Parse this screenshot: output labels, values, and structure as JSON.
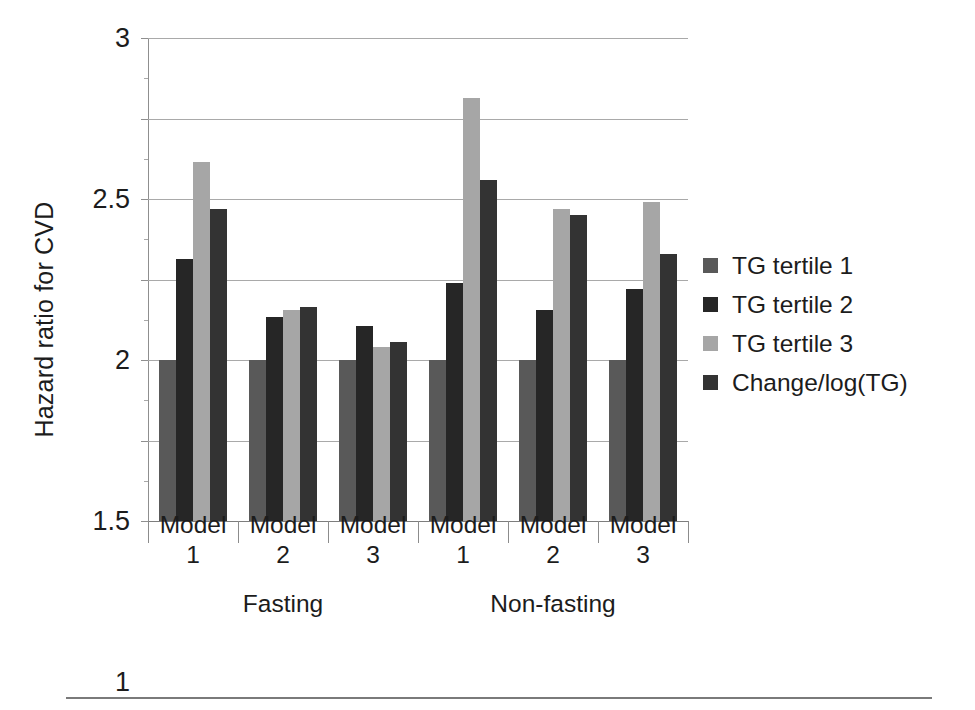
{
  "chart_data": {
    "type": "bar",
    "title": "",
    "subtitle": "",
    "xlabel": "",
    "ylabel": "Hazard ratio for CVD",
    "ylim": [
      0,
      3
    ],
    "yticks": [
      "0",
      "0.5",
      "1",
      "1.5",
      "2",
      "2.5",
      "3"
    ],
    "ytick_values": [
      0,
      0.5,
      1,
      1.5,
      2,
      2.5,
      3
    ],
    "grid": "horizontal",
    "legend_position": "right",
    "categories": [
      "Model 1",
      "Model 2",
      "Model 3",
      "Model 1",
      "Model 2",
      "Model 3"
    ],
    "category_lines": [
      [
        "Model",
        "1"
      ],
      [
        "Model",
        "2"
      ],
      [
        "Model",
        "3"
      ],
      [
        "Model",
        "1"
      ],
      [
        "Model",
        "2"
      ],
      [
        "Model",
        "3"
      ]
    ],
    "supergroups": [
      {
        "label": "Fasting",
        "categories": [
          "Model 1",
          "Model 2",
          "Model 3"
        ]
      },
      {
        "label": "Non-fasting",
        "categories": [
          "Model 1",
          "Model 2",
          "Model 3"
        ]
      }
    ],
    "series": [
      {
        "name": "TG tertile 1",
        "color": "#595959",
        "values": [
          1.0,
          1.0,
          1.0,
          1.0,
          1.0,
          1.0
        ]
      },
      {
        "name": "TG tertile 2",
        "color": "#262626",
        "values": [
          1.63,
          1.27,
          1.21,
          1.48,
          1.31,
          1.44
        ]
      },
      {
        "name": "TG tertile 3",
        "color": "#a6a6a6",
        "values": [
          2.23,
          1.31,
          1.08,
          2.63,
          1.94,
          1.98
        ]
      },
      {
        "name": "Change/log(TG)",
        "color": "#333333",
        "values": [
          1.94,
          1.33,
          1.11,
          2.12,
          1.9,
          1.66
        ]
      }
    ]
  },
  "legend": {
    "items": [
      {
        "label": "TG tertile 1",
        "color": "#595959"
      },
      {
        "label": "TG tertile 2",
        "color": "#262626"
      },
      {
        "label": "TG tertile 3",
        "color": "#a6a6a6"
      },
      {
        "label": "Change/log(TG)",
        "color": "#333333"
      }
    ]
  },
  "axes": {
    "y_title": "Hazard ratio for CVD"
  }
}
